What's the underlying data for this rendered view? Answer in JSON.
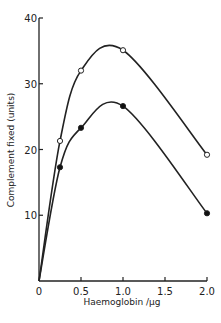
{
  "chart_data": {
    "type": "line",
    "title": "",
    "xlabel": "Haemoglobin /µg",
    "ylabel": "Complement fixed (units)",
    "xlim": [
      0,
      2.0
    ],
    "ylim": [
      0,
      40
    ],
    "x_ticks": [
      "0",
      "0.5",
      "1.0",
      "1.5",
      "2.0"
    ],
    "y_ticks": [
      "10",
      "20",
      "30",
      "40"
    ],
    "grid": false,
    "legend": null,
    "series": [
      {
        "name": "open circles",
        "marker": "open-circle",
        "x": [
          0,
          0.25,
          0.5,
          1.0,
          2.0
        ],
        "values": [
          0,
          21.3,
          32,
          35.1,
          19.2
        ]
      },
      {
        "name": "filled circles",
        "marker": "filled-circle",
        "x": [
          0,
          0.25,
          0.5,
          1.0,
          2.0
        ],
        "values": [
          0,
          17.3,
          23.3,
          26.6,
          10.3
        ]
      }
    ]
  }
}
